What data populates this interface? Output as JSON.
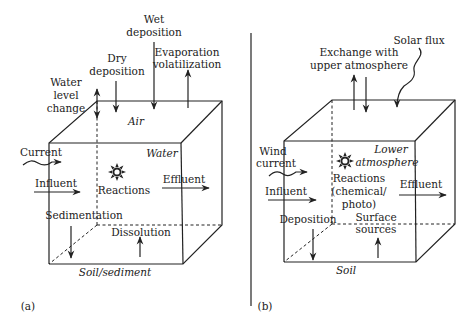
{
  "panel_a": {
    "tag": "(a)",
    "labels": {
      "wet_deposition_1": "Wet",
      "wet_deposition_2": "deposition",
      "dry_deposition_1": "Dry",
      "dry_deposition_2": "deposition",
      "evaporation_1": "Evaporation",
      "evaporation_2": "volatilization",
      "water_level_1": "Water",
      "water_level_2": "level",
      "water_level_3": "change",
      "air": "Air",
      "water": "Water",
      "current": "Current",
      "influent": "Influent",
      "reactions": "Reactions",
      "effluent": "Effluent",
      "sedimentation": "Sedimentation",
      "dissolution": "Dissolution",
      "soil_sediment": "Soil/sediment"
    }
  },
  "panel_b": {
    "tag": "(b)",
    "labels": {
      "exchange_1": "Exchange with",
      "exchange_2": "upper atmosphere",
      "solar_flux": "Solar flux",
      "wind_current_1": "Wind",
      "wind_current_2": "current",
      "lower_atm_1": "Lower",
      "lower_atm_2": "atmosphere",
      "influent": "Influent",
      "reactions_1": "Reactions",
      "reactions_2": "(chemical/",
      "reactions_3": "photo)",
      "effluent": "Effluent",
      "deposition": "Deposition",
      "surface_sources_1": "Surface",
      "surface_sources_2": "sources",
      "soil": "Soil"
    }
  },
  "icons": {
    "reaction_icon": "sun-burst"
  }
}
